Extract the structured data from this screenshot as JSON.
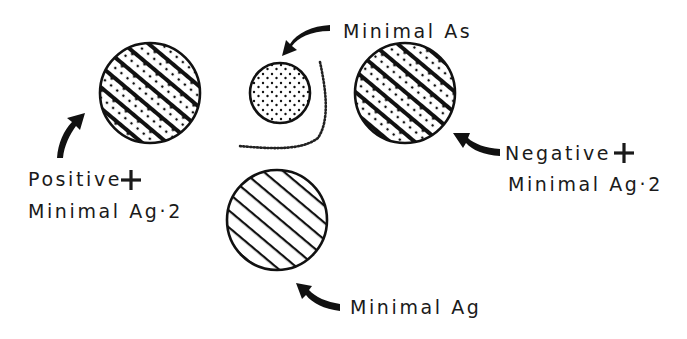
{
  "diagram": {
    "type": "antigen-antibody precipitation schematic",
    "circles": [
      {
        "id": "positive",
        "fill_pattern": "hatched-dotted",
        "cx": 150,
        "cy": 93,
        "r": 50
      },
      {
        "id": "minimal-as",
        "fill_pattern": "dotted",
        "cx": 280,
        "cy": 93,
        "r": 30
      },
      {
        "id": "negative",
        "fill_pattern": "hatched-dotted",
        "cx": 405,
        "cy": 93,
        "r": 50
      },
      {
        "id": "minimal-ag",
        "fill_pattern": "hatched",
        "cx": 277,
        "cy": 220,
        "r": 50
      }
    ],
    "labels": {
      "minimal_as": "Minimal As",
      "positive_line1": "Positive",
      "positive_line2": "Minimal Ag·2",
      "negative_line1": "Negative",
      "negative_line2": "Minimal Ag·2",
      "minimal_ag": "Minimal Ag"
    },
    "symbols": {
      "plus": "+"
    },
    "colors": {
      "ink": "#111111",
      "background": "#ffffff"
    }
  }
}
